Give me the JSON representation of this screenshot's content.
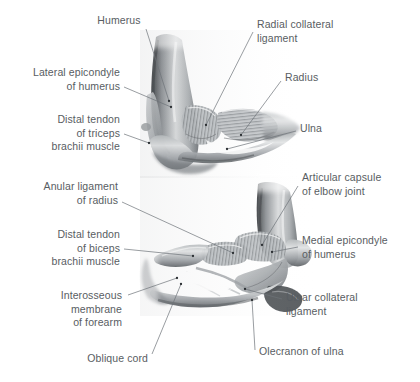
{
  "figure": {
    "background_color": "#ffffff",
    "text_color": "#585d62",
    "leader_line_color": "#6d7378",
    "illustration_style": "grayscale anatomical pencil rendering"
  },
  "panels": [
    {
      "id": "panel-upper",
      "name": "lateral-view-of-elbow",
      "view": "Lateral view",
      "labels": [
        {
          "id": "humerus",
          "text": "Humerus",
          "align": "center",
          "x": 93,
          "y": 14,
          "width": 52,
          "leader": {
            "x1": 146,
            "y1": 29,
            "x2": 169,
            "y2": 101
          }
        },
        {
          "id": "lateral-epicondyle-of-humerus",
          "text": "Lateral epicondyle\nof humerus",
          "align": "right",
          "x": 8,
          "y": 66,
          "width": 112,
          "leader": {
            "x1": 124,
            "y1": 87,
            "x2": 171,
            "y2": 107
          }
        },
        {
          "id": "distal-tendon-of-triceps-brachii-muscle",
          "text": "Distal tendon\nof triceps\nbrachii muscle",
          "align": "right",
          "x": 8,
          "y": 113,
          "width": 112,
          "leader": {
            "x1": 124,
            "y1": 134,
            "x2": 149,
            "y2": 143
          }
        },
        {
          "id": "radial-collateral-ligament",
          "text": "Radial collateral\nligament",
          "align": "left",
          "x": 257,
          "y": 18,
          "width": 120,
          "leader": {
            "x1": 253,
            "y1": 32,
            "x2": 206,
            "y2": 125
          }
        },
        {
          "id": "radius",
          "text": "Radius",
          "align": "left",
          "x": 285,
          "y": 71,
          "width": 60,
          "leader": {
            "x1": 281,
            "y1": 81,
            "x2": 241,
            "y2": 135
          }
        },
        {
          "id": "ulna",
          "text": "Ulna",
          "align": "left",
          "x": 300,
          "y": 122,
          "width": 50,
          "leader": {
            "x1": 296,
            "y1": 131,
            "x2": 227,
            "y2": 149
          }
        }
      ]
    },
    {
      "id": "panel-lower",
      "name": "medial-view-of-elbow",
      "view": "Medial view",
      "labels": [
        {
          "id": "anular-ligament-of-radius",
          "text": "Anular ligament\nof radius",
          "align": "right",
          "x": 8,
          "y": 180,
          "width": 110,
          "leader": {
            "x1": 122,
            "y1": 202,
            "x2": 233,
            "y2": 253
          }
        },
        {
          "id": "distal-tendon-of-biceps-brachii-muscle",
          "text": "Distal tendon\nof biceps\nbrachii muscle",
          "align": "right",
          "x": 8,
          "y": 228,
          "width": 112,
          "leader": {
            "x1": 124,
            "y1": 249,
            "x2": 193,
            "y2": 256
          }
        },
        {
          "id": "interosseous-membrane-of-forearm",
          "text": "Interosseous\nmembrane\nof forearm",
          "align": "right",
          "x": 8,
          "y": 289,
          "width": 114,
          "leader": {
            "x1": 128,
            "y1": 295,
            "x2": 177,
            "y2": 278
          }
        },
        {
          "id": "oblique-cord",
          "text": "Oblique cord",
          "align": "right",
          "x": 60,
          "y": 352,
          "width": 88,
          "leader": {
            "x1": 152,
            "y1": 354,
            "x2": 181,
            "y2": 284
          }
        },
        {
          "id": "articular-capsule-of-elbow-joint",
          "text": "Articular capsule\nof elbow joint",
          "align": "left",
          "x": 302,
          "y": 171,
          "width": 116,
          "leader": {
            "x1": 298,
            "y1": 186,
            "x2": 262,
            "y2": 245
          }
        },
        {
          "id": "medial-epicondyle-of-humerus",
          "text": "Medial epicondyle\nof humerus",
          "align": "left",
          "x": 302,
          "y": 234,
          "width": 116,
          "leader": {
            "x1": 298,
            "y1": 247,
            "x2": 272,
            "y2": 252
          }
        },
        {
          "id": "ulnar-collateral-ligament",
          "text": "Ulnar collateral\nligament",
          "align": "left",
          "x": 286,
          "y": 291,
          "width": 116,
          "leader": {
            "x1": 282,
            "y1": 299,
            "x2": 245,
            "y2": 289
          }
        },
        {
          "id": "olecranon-of-ulna",
          "text": "Olecranon of ulna",
          "align": "left",
          "x": 259,
          "y": 345,
          "width": 116,
          "leader": {
            "x1": 255,
            "y1": 350,
            "x2": 252,
            "y2": 300
          }
        }
      ]
    }
  ]
}
